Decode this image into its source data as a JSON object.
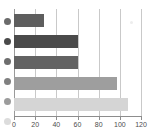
{
  "chart_data": {
    "type": "bar",
    "orientation": "horizontal",
    "title": "",
    "subtitle": "",
    "xlabel": "",
    "ylabel": "",
    "xlim": [
      0,
      120
    ],
    "ylim": null,
    "grid": true,
    "grid_axis": "x",
    "legend": "left-gutter-markers",
    "categories": [
      "",
      "",
      "",
      "",
      ""
    ],
    "values": [
      28,
      60,
      60,
      97,
      108
    ],
    "tick_values": [
      0,
      20,
      40,
      60,
      80,
      100,
      120
    ],
    "tick_labels": [
      "0",
      "20",
      "40",
      "60",
      "80",
      "100",
      "120"
    ],
    "series": [
      {
        "name": "",
        "values": [
          28,
          60,
          60,
          97,
          108
        ],
        "colors": [
          "#5e5e5e",
          "#4a4a4a",
          "#636363",
          "#9e9e9e",
          "#d5d5d5"
        ]
      }
    ],
    "bars": [
      {
        "label": "",
        "value": 28,
        "color": "#5e5e5e"
      },
      {
        "label": "",
        "value": 60,
        "color": "#4a4a4a"
      },
      {
        "label": "",
        "value": 60,
        "color": "#636363"
      },
      {
        "label": "",
        "value": 97,
        "color": "#9e9e9e"
      },
      {
        "label": "",
        "value": 108,
        "color": "#d5d5d5"
      }
    ],
    "markers": [
      {
        "label": "",
        "color": "#6b6b6b"
      },
      {
        "label": "",
        "color": "#4a4a4a"
      },
      {
        "label": "",
        "color": "#6e6e6e"
      },
      {
        "label": "",
        "color": "#808080"
      },
      {
        "label": "",
        "color": "#9c9c9c"
      },
      {
        "label": "",
        "color": "#dcdcdc"
      }
    ],
    "colors": {
      "grid": "#c9c9c9",
      "axis": "#8d8d8d",
      "tick_label": "#4d4d4d",
      "background": "#ffffff"
    }
  }
}
